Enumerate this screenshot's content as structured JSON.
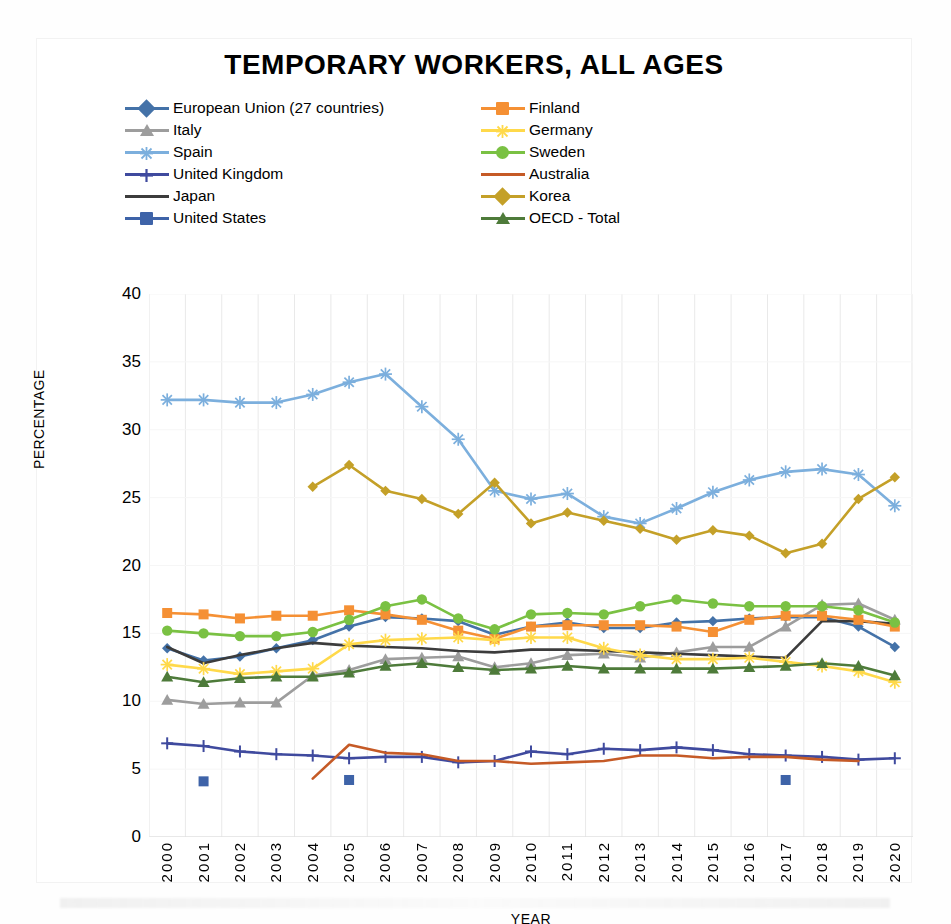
{
  "chart_data": {
    "type": "line",
    "title": "TEMPORARY WORKERS, ALL AGES",
    "xlabel": "YEAR",
    "ylabel": "PERCENTAGE",
    "ylim": [
      0,
      40
    ],
    "ytick_step": 5,
    "yticks": [
      "0",
      "5",
      "10",
      "15",
      "20",
      "25",
      "30",
      "35",
      "40"
    ],
    "grid": "vertical",
    "legend_position": "top",
    "categories": [
      "2000",
      "2001",
      "2002",
      "2003",
      "2004",
      "2005",
      "2006",
      "2007",
      "2008",
      "2009",
      "2010",
      "2011",
      "2012",
      "2013",
      "2014",
      "2015",
      "2016",
      "2017",
      "2018",
      "2019",
      "2020"
    ],
    "series": [
      {
        "name": "European Union (27 countries)",
        "color": "#4472a8",
        "marker": "diamond",
        "values": [
          13.9,
          13.0,
          13.3,
          13.9,
          14.5,
          15.5,
          16.2,
          16.1,
          15.9,
          14.9,
          15.5,
          15.8,
          15.4,
          15.4,
          15.8,
          15.9,
          16.1,
          16.2,
          16.2,
          15.5,
          14.0
        ]
      },
      {
        "name": "Italy",
        "color": "#9d9d9d",
        "marker": "triangle",
        "values": [
          10.1,
          9.8,
          9.9,
          9.9,
          11.9,
          12.3,
          13.1,
          13.2,
          13.3,
          12.5,
          12.8,
          13.4,
          13.5,
          13.2,
          13.6,
          14.0,
          14.0,
          15.5,
          17.1,
          17.2,
          16.0
        ]
      },
      {
        "name": "Spain",
        "color": "#7cafdd",
        "marker": "asterisk",
        "values": [
          32.2,
          32.2,
          32.0,
          32.0,
          32.6,
          33.5,
          34.1,
          31.7,
          29.3,
          25.5,
          24.9,
          25.3,
          23.6,
          23.1,
          24.2,
          25.4,
          26.3,
          26.9,
          27.1,
          26.7,
          24.4
        ]
      },
      {
        "name": "United Kingdom",
        "color": "#3f4a9e",
        "marker": "plus",
        "values": [
          6.9,
          6.7,
          6.3,
          6.1,
          6.0,
          5.8,
          5.9,
          5.9,
          5.5,
          5.6,
          6.3,
          6.1,
          6.5,
          6.4,
          6.6,
          6.4,
          6.1,
          6.0,
          5.9,
          5.7,
          5.8
        ]
      },
      {
        "name": "Japan",
        "color": "#3c3c3c",
        "marker": "line",
        "values": [
          14.0,
          12.8,
          13.4,
          13.9,
          14.3,
          14.1,
          14.0,
          13.9,
          13.7,
          13.6,
          13.8,
          13.8,
          13.7,
          13.6,
          13.5,
          13.4,
          13.3,
          13.2,
          15.9,
          15.9,
          15.7
        ]
      },
      {
        "name": "United States",
        "color": "#3e63a8",
        "marker": "square",
        "values": [
          null,
          4.1,
          null,
          null,
          null,
          4.2,
          null,
          null,
          null,
          null,
          null,
          null,
          null,
          null,
          null,
          null,
          null,
          4.2,
          null,
          null,
          null
        ]
      },
      {
        "name": "Finland",
        "color": "#f59034",
        "marker": "square",
        "values": [
          16.5,
          16.4,
          16.1,
          16.3,
          16.3,
          16.7,
          16.4,
          16.0,
          15.2,
          14.6,
          15.5,
          15.6,
          15.6,
          15.6,
          15.5,
          15.1,
          16.0,
          16.3,
          16.3,
          16.0,
          15.5
        ]
      },
      {
        "name": "Germany",
        "color": "#ffd94a",
        "marker": "asterisk",
        "values": [
          12.7,
          12.4,
          12.0,
          12.2,
          12.4,
          14.2,
          14.5,
          14.6,
          14.7,
          14.5,
          14.7,
          14.7,
          13.9,
          13.4,
          13.1,
          13.1,
          13.2,
          12.9,
          12.6,
          12.2,
          11.4
        ]
      },
      {
        "name": "Sweden",
        "color": "#7ac143",
        "marker": "circle",
        "values": [
          15.2,
          15.0,
          14.8,
          14.8,
          15.1,
          16.0,
          17.0,
          17.5,
          16.1,
          15.3,
          16.4,
          16.5,
          16.4,
          17.0,
          17.5,
          17.2,
          17.0,
          17.0,
          17.0,
          16.7,
          15.8
        ]
      },
      {
        "name": "Australia",
        "color": "#c55a26",
        "marker": "line",
        "values": [
          null,
          4.3,
          null,
          null,
          4.3,
          6.8,
          6.2,
          6.1,
          5.6,
          5.6,
          5.4,
          5.5,
          5.6,
          6.0,
          6.0,
          5.8,
          5.9,
          5.9,
          5.7,
          5.6,
          null
        ]
      },
      {
        "name": "Korea",
        "color": "#c4a028",
        "marker": "diamond",
        "values": [
          null,
          null,
          null,
          null,
          25.8,
          27.4,
          25.5,
          24.9,
          23.8,
          26.1,
          23.1,
          23.9,
          23.3,
          22.7,
          21.9,
          22.6,
          22.2,
          20.9,
          21.6,
          24.9,
          26.5
        ]
      },
      {
        "name": "OECD - Total",
        "color": "#4e7b3a",
        "marker": "triangle",
        "values": [
          11.8,
          11.4,
          11.7,
          11.8,
          11.8,
          12.1,
          12.6,
          12.8,
          12.5,
          12.3,
          12.4,
          12.6,
          12.4,
          12.4,
          12.4,
          12.4,
          12.5,
          12.6,
          12.8,
          12.6,
          11.9
        ]
      }
    ]
  },
  "legend": {
    "left_column": [
      {
        "label": "European Union (27 countries)",
        "series_index": 0
      },
      {
        "label": "Italy",
        "series_index": 1
      },
      {
        "label": "Spain",
        "series_index": 2
      },
      {
        "label": "United Kingdom",
        "series_index": 3
      },
      {
        "label": "Japan",
        "series_index": 4
      },
      {
        "label": "United States",
        "series_index": 5
      }
    ],
    "right_column": [
      {
        "label": "Finland",
        "series_index": 6
      },
      {
        "label": "Germany",
        "series_index": 7
      },
      {
        "label": "Sweden",
        "series_index": 8
      },
      {
        "label": "Australia",
        "series_index": 9
      },
      {
        "label": "Korea",
        "series_index": 10
      },
      {
        "label": "OECD - Total",
        "series_index": 11
      }
    ]
  },
  "page": {
    "bottom_caption": ""
  }
}
